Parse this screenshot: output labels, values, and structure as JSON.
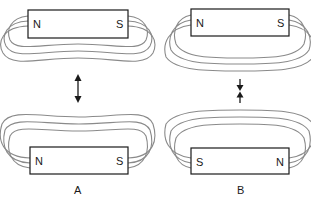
{
  "diagram": {
    "panels": [
      {
        "caption": "A",
        "top_magnet": {
          "left_pole": "N",
          "right_pole": "S"
        },
        "bottom_magnet": {
          "left_pole": "N",
          "right_pole": "S"
        },
        "arrow": "double-headed-vertical",
        "interaction": "repel"
      },
      {
        "caption": "B",
        "top_magnet": {
          "left_pole": "N",
          "right_pole": "S"
        },
        "bottom_magnet": {
          "left_pole": "S",
          "right_pole": "N"
        },
        "arrow": "converging-vertical",
        "interaction": "attract"
      }
    ],
    "colors": {
      "field_lines": "#8a8a8a",
      "outline": "#1a1a1a",
      "background": "#ffffff"
    }
  }
}
